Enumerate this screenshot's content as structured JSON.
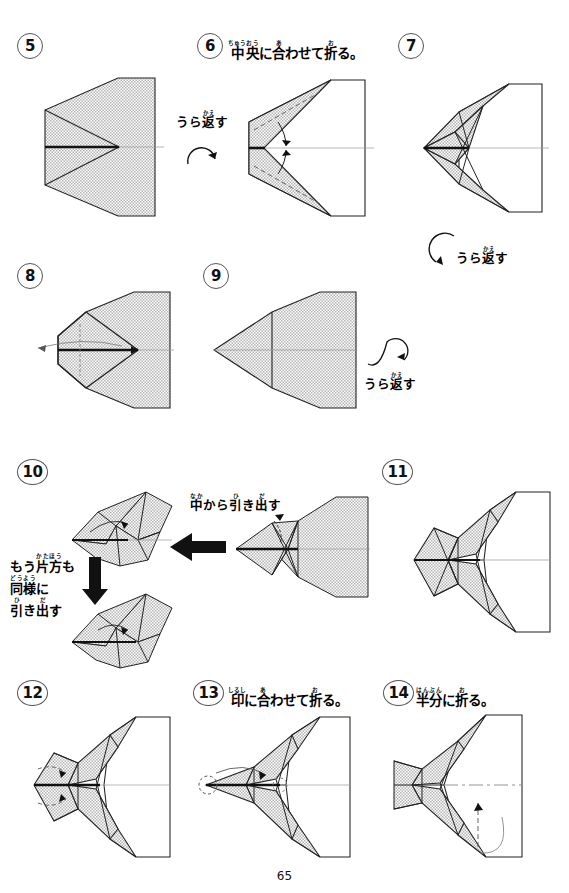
{
  "page": {
    "number": "65",
    "language": "ja",
    "background": "#ffffff",
    "ink": "#1a1a1a",
    "shade_fill": "#d9d9d9"
  },
  "steps": [
    {
      "id": "step-5",
      "number": "5",
      "caption": null,
      "caption_plain": ""
    },
    {
      "id": "step-6",
      "number": "6",
      "caption_plain": "中央に合わせて折る。",
      "caption_parts": [
        {
          "base": "中",
          "ruby": "ちゅう"
        },
        {
          "base": "央",
          "ruby": "おう"
        },
        {
          "base": "に",
          "ruby": ""
        },
        {
          "base": "合",
          "ruby": "あ"
        },
        {
          "base": "わせて",
          "ruby": ""
        },
        {
          "base": "折",
          "ruby": "お"
        },
        {
          "base": "る。",
          "ruby": ""
        }
      ]
    },
    {
      "id": "step-7",
      "number": "7",
      "caption_plain": ""
    },
    {
      "id": "step-8",
      "number": "8",
      "caption_plain": ""
    },
    {
      "id": "step-9",
      "number": "9",
      "caption_plain": ""
    },
    {
      "id": "step-10",
      "number": "10",
      "caption_plain": ""
    },
    {
      "id": "step-11",
      "number": "11",
      "caption_plain": ""
    },
    {
      "id": "step-12",
      "number": "12",
      "caption_plain": ""
    },
    {
      "id": "step-13",
      "number": "13",
      "caption_plain": "印に合わせて折る。",
      "caption_parts": [
        {
          "base": "印",
          "ruby": "しるし"
        },
        {
          "base": "に",
          "ruby": ""
        },
        {
          "base": "合",
          "ruby": "あ"
        },
        {
          "base": "わせて",
          "ruby": ""
        },
        {
          "base": "折",
          "ruby": "お"
        },
        {
          "base": "る。",
          "ruby": ""
        }
      ]
    },
    {
      "id": "step-14",
      "number": "14",
      "caption_plain": "半分に折る。",
      "caption_parts": [
        {
          "base": "半分",
          "ruby": "はんぶん"
        },
        {
          "base": "に",
          "ruby": ""
        },
        {
          "base": "折",
          "ruby": "お"
        },
        {
          "base": "る。",
          "ruby": ""
        }
      ]
    }
  ],
  "annotations": {
    "turn_over_1": {
      "text_plain": "うら返す",
      "parts": [
        {
          "base": "うら",
          "ruby": ""
        },
        {
          "base": "返",
          "ruby": "かえ"
        },
        {
          "base": "す",
          "ruby": ""
        }
      ]
    },
    "turn_over_2": {
      "text_plain": "うら返す",
      "parts": [
        {
          "base": "うら",
          "ruby": ""
        },
        {
          "base": "返",
          "ruby": "かえ"
        },
        {
          "base": "す",
          "ruby": ""
        }
      ]
    },
    "turn_over_3": {
      "text_plain": "うら返す",
      "parts": [
        {
          "base": "うら",
          "ruby": ""
        },
        {
          "base": "返",
          "ruby": "かえ"
        },
        {
          "base": "す",
          "ruby": ""
        }
      ]
    },
    "pull_from_inside": {
      "text_plain": "中から引き出す",
      "parts": [
        {
          "base": "中",
          "ruby": "なか"
        },
        {
          "base": "から",
          "ruby": ""
        },
        {
          "base": "引",
          "ruby": "ひ"
        },
        {
          "base": "き",
          "ruby": ""
        },
        {
          "base": "出",
          "ruby": "だ"
        },
        {
          "base": "す",
          "ruby": ""
        }
      ]
    },
    "other_side_same": {
      "text_plain": "もう片方も同様に引き出す",
      "lines": [
        [
          {
            "base": "もう",
            "ruby": ""
          },
          {
            "base": "片方",
            "ruby": "かたほう"
          },
          {
            "base": "も",
            "ruby": ""
          }
        ],
        [
          {
            "base": "同様",
            "ruby": "どうよう"
          },
          {
            "base": "に",
            "ruby": ""
          }
        ],
        [
          {
            "base": "引",
            "ruby": "ひ"
          },
          {
            "base": "き",
            "ruby": ""
          },
          {
            "base": "出",
            "ruby": "だ"
          },
          {
            "base": "す",
            "ruby": ""
          }
        ]
      ]
    }
  }
}
